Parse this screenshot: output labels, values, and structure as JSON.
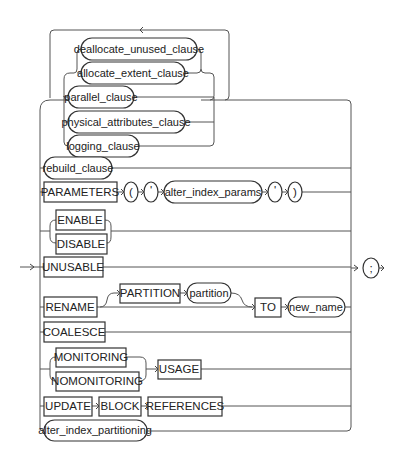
{
  "diagram": {
    "type": "syntax-railroad",
    "loop_arrow": "<",
    "repeatable_group": [
      {
        "label": "deallocate_unused_clause",
        "kind": "nonterminal"
      },
      {
        "label": "allocate_extent_clause",
        "kind": "nonterminal"
      },
      {
        "label": "parallel_clause",
        "kind": "nonterminal"
      },
      {
        "label": "physical_attributes_clause",
        "kind": "nonterminal"
      },
      {
        "label": "logging_clause",
        "kind": "nonterminal"
      }
    ],
    "rebuild": {
      "label": "rebuild_clause",
      "kind": "nonterminal"
    },
    "parameters": {
      "keyword": "PARAMETERS",
      "open_paren": "(",
      "open_quote": "'",
      "param": "alter_index_params",
      "close_quote": "'",
      "close_paren": ")"
    },
    "enable_disable": {
      "enable": "ENABLE",
      "disable": "DISABLE"
    },
    "unusable": "UNUSABLE",
    "rename": {
      "keyword": "RENAME",
      "partition_keyword": "PARTITION",
      "partition": "partition",
      "to": "TO",
      "new_name": "new_name"
    },
    "coalesce": "COALESCE",
    "monitoring": {
      "monitoring": "MONITORING",
      "nomonitoring": "NOMONITORING",
      "usage": "USAGE"
    },
    "update_block": {
      "update": "UPDATE",
      "block": "BLOCK",
      "references": "REFERENCES"
    },
    "partitioning": {
      "label": "alter_index_partitioning",
      "kind": "nonterminal"
    },
    "terminator": ";"
  }
}
